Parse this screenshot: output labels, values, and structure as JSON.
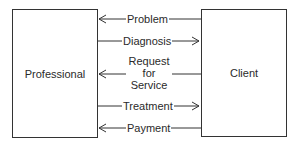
{
  "diagram": {
    "left_entity": "Professional",
    "right_entity": "Client",
    "flows": [
      {
        "label": "Problem",
        "direction": "to-professional"
      },
      {
        "label": "Diagnosis",
        "direction": "to-client"
      },
      {
        "label_lines": [
          "Request",
          "for",
          "Service"
        ],
        "direction": "to-professional"
      },
      {
        "label": "Treatment",
        "direction": "to-client"
      },
      {
        "label": "Payment",
        "direction": "to-professional"
      }
    ]
  }
}
